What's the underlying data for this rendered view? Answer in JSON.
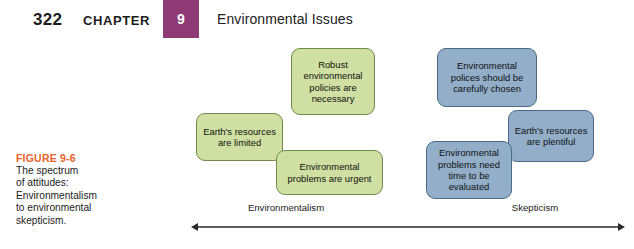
{
  "running_head": {
    "page_number": "322",
    "chapter_word": "CHAPTER",
    "chapter_number": "9",
    "title": "Environmental Issues",
    "badge_color": "#8e3a74"
  },
  "caption": {
    "label": "FIGURE 9-6",
    "label_color": "#e8622a",
    "line1": "The spectrum",
    "line2": "of attitudes:",
    "line3": "Environmentalism",
    "line4": "to environmental",
    "line5": "skepticism."
  },
  "diagram": {
    "type": "spectrum",
    "green_color": "#cfe0a2",
    "green_border": "#6f8a4a",
    "blue_color": "#93aec9",
    "blue_border": "#4b6a88",
    "nodes": [
      {
        "id": "robust-policies",
        "side": "environmentalism",
        "color": "green",
        "text": "Robust environmental policies are necessary"
      },
      {
        "id": "resources-limited",
        "side": "environmentalism",
        "color": "green",
        "text": "Earth's resources are limited"
      },
      {
        "id": "problems-urgent",
        "side": "environmentalism",
        "color": "green",
        "text": "Environmental problems are urgent"
      },
      {
        "id": "policies-carefully-chosen",
        "side": "skepticism",
        "color": "blue",
        "text": "Environmental polices should be carefully chosen"
      },
      {
        "id": "resources-plentiful",
        "side": "skepticism",
        "color": "blue",
        "text": "Earth's resources are plentiful"
      },
      {
        "id": "problems-need-time",
        "side": "skepticism",
        "color": "blue",
        "text": "Environmental problems need time to be evaluated"
      }
    ],
    "axis": {
      "left_label": "Environmentalism",
      "right_label": "Skepticism",
      "arrow_style": "double-headed"
    }
  }
}
